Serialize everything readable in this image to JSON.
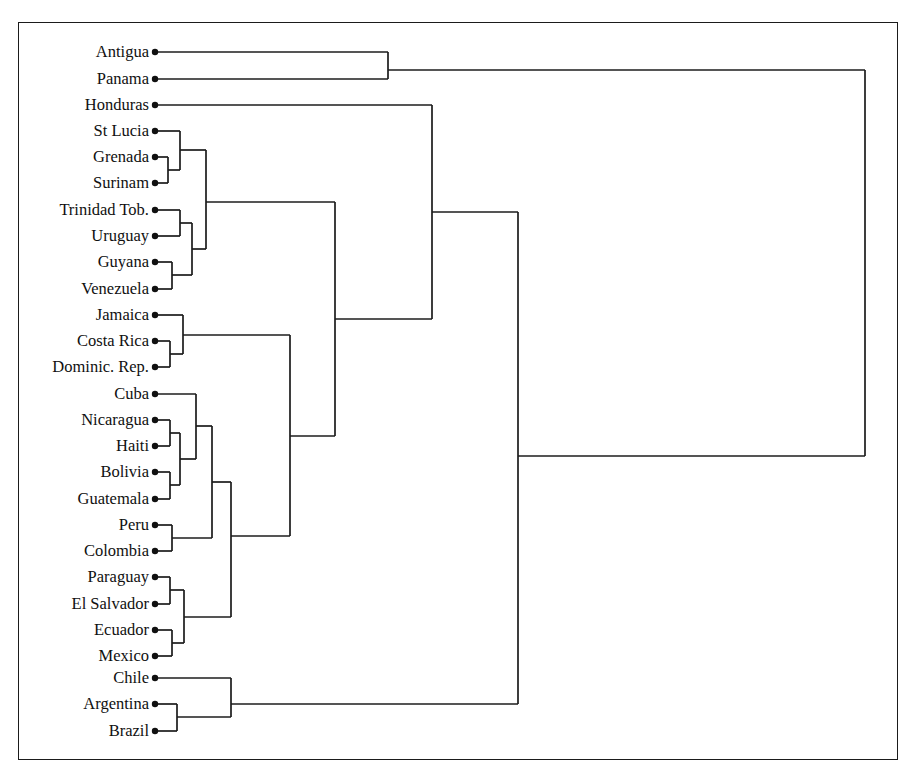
{
  "figure": {
    "type": "dendrogram",
    "orientation": "horizontal-left-to-right",
    "background_color": "#ffffff",
    "line_color": "#1c1c1c",
    "label_color": "#101010",
    "frame": {
      "x": 18,
      "y": 22,
      "width": 880,
      "height": 738,
      "border_color": "#1b1b1b"
    }
  },
  "leaves": [
    {
      "index": 0,
      "label": "Antigua",
      "x": 155,
      "y": 52
    },
    {
      "index": 1,
      "label": "Panama",
      "x": 155,
      "y": 79
    },
    {
      "index": 2,
      "label": "Honduras",
      "x": 155,
      "y": 105
    },
    {
      "index": 3,
      "label": "St Lucia",
      "x": 155,
      "y": 131
    },
    {
      "index": 4,
      "label": "Grenada",
      "x": 155,
      "y": 157
    },
    {
      "index": 5,
      "label": "Surinam",
      "x": 155,
      "y": 183
    },
    {
      "index": 6,
      "label": "Trinidad Tob.",
      "x": 155,
      "y": 210
    },
    {
      "index": 7,
      "label": "Uruguay",
      "x": 155,
      "y": 236
    },
    {
      "index": 8,
      "label": "Guyana",
      "x": 155,
      "y": 262
    },
    {
      "index": 9,
      "label": "Venezuela",
      "x": 155,
      "y": 289
    },
    {
      "index": 10,
      "label": "Jamaica",
      "x": 155,
      "y": 315
    },
    {
      "index": 11,
      "label": "Costa Rica",
      "x": 155,
      "y": 341
    },
    {
      "index": 12,
      "label": "Dominic. Rep.",
      "x": 155,
      "y": 367
    },
    {
      "index": 13,
      "label": "Cuba",
      "x": 155,
      "y": 394
    },
    {
      "index": 14,
      "label": "Nicaragua",
      "x": 155,
      "y": 420
    },
    {
      "index": 15,
      "label": "Haiti",
      "x": 155,
      "y": 446
    },
    {
      "index": 16,
      "label": "Bolivia",
      "x": 155,
      "y": 472
    },
    {
      "index": 17,
      "label": "Guatemala",
      "x": 155,
      "y": 499
    },
    {
      "index": 18,
      "label": "Peru",
      "x": 155,
      "y": 525
    },
    {
      "index": 19,
      "label": "Colombia",
      "x": 155,
      "y": 551
    },
    {
      "index": 20,
      "label": "Paraguay",
      "x": 155,
      "y": 577
    },
    {
      "index": 21,
      "label": "El Salvador",
      "x": 155,
      "y": 604
    },
    {
      "index": 22,
      "label": "Ecuador",
      "x": 155,
      "y": 630
    },
    {
      "index": 23,
      "label": "Mexico",
      "x": 155,
      "y": 656
    },
    {
      "index": 24,
      "label": "Chile",
      "x": 155,
      "y": 678
    },
    {
      "index": 25,
      "label": "Argentina",
      "x": 155,
      "y": 704
    },
    {
      "index": 26,
      "label": "Brazil",
      "x": 155,
      "y": 731
    }
  ],
  "label_right_edge": 149,
  "merges": [
    {
      "name": "grenada-surinam",
      "x": 168,
      "y1": 157,
      "y2": 183,
      "y_out": 170
    },
    {
      "name": "stlucia-grenadasurinam",
      "x": 180,
      "y1": 131,
      "y2": 170,
      "y_out": 150
    },
    {
      "name": "trinidad-uruguay",
      "x": 180,
      "y1": 210,
      "y2": 236,
      "y_out": 223
    },
    {
      "name": "guyana-venezuela",
      "x": 172,
      "y1": 262,
      "y2": 289,
      "y_out": 275
    },
    {
      "name": "trinidaduruguay-guyanaven",
      "x": 192,
      "y1": 223,
      "y2": 275,
      "y_out": 249
    },
    {
      "name": "caribbean-southamerican",
      "x": 206,
      "y1": 150,
      "y2": 249,
      "y_out": 202
    },
    {
      "name": "costarica-dominicrep",
      "x": 170,
      "y1": 341,
      "y2": 367,
      "y_out": 354
    },
    {
      "name": "jamaica-costaricadominic",
      "x": 183,
      "y1": 315,
      "y2": 354,
      "y_out": 335
    },
    {
      "name": "nicaragua-haiti",
      "x": 170,
      "y1": 420,
      "y2": 446,
      "y_out": 433
    },
    {
      "name": "bolivia-guatemala",
      "x": 170,
      "y1": 472,
      "y2": 499,
      "y_out": 485
    },
    {
      "name": "nicaraguahaiti-boliviaguat",
      "x": 180,
      "y1": 433,
      "y2": 485,
      "y_out": 459
    },
    {
      "name": "cuba-andean",
      "x": 196,
      "y1": 394,
      "y2": 459,
      "y_out": 426
    },
    {
      "name": "peru-colombia",
      "x": 172,
      "y1": 525,
      "y2": 551,
      "y_out": 538
    },
    {
      "name": "cubaandean-perucolombia",
      "x": 212,
      "y1": 426,
      "y2": 538,
      "y_out": 482
    },
    {
      "name": "paraguay-elsalvador",
      "x": 170,
      "y1": 577,
      "y2": 604,
      "y_out": 590
    },
    {
      "name": "ecuador-mexico",
      "x": 172,
      "y1": 630,
      "y2": 656,
      "y_out": 643
    },
    {
      "name": "paraguaysalv-ecuadormexico",
      "x": 184,
      "y1": 590,
      "y2": 643,
      "y_out": 617
    },
    {
      "name": "cluster-central-america",
      "x": 231,
      "y1": 482,
      "y2": 617,
      "y_out": 536
    },
    {
      "name": "jamaicagrp-centralamerica",
      "x": 290,
      "y1": 335,
      "y2": 536,
      "y_out": 436
    },
    {
      "name": "caribbean-mainland",
      "x": 335,
      "y1": 202,
      "y2": 436,
      "y_out": 319
    },
    {
      "name": "honduras-cluster",
      "x": 432,
      "y1": 105,
      "y2": 319,
      "y_out": 212
    },
    {
      "name": "argentina-brazil",
      "x": 177,
      "y1": 704,
      "y2": 731,
      "y_out": 717
    },
    {
      "name": "chile-argentinabrazil",
      "x": 231,
      "y1": 678,
      "y2": 717,
      "y_out": 704
    },
    {
      "name": "mainbody-southerncone",
      "x": 518,
      "y1": 212,
      "y2": 704,
      "y_out": 456
    },
    {
      "name": "antigua-panama",
      "x": 388,
      "y1": 52,
      "y2": 79,
      "y_out": 70
    },
    {
      "name": "root",
      "x": 865,
      "y1": 70,
      "y2": 456,
      "y_out": 263
    }
  ],
  "chart_data": {
    "type": "dendrogram",
    "title": "",
    "xlabel": "",
    "ylabel": "",
    "leaf_order": [
      "Antigua",
      "Panama",
      "Honduras",
      "St Lucia",
      "Grenada",
      "Surinam",
      "Trinidad Tob.",
      "Uruguay",
      "Guyana",
      "Venezuela",
      "Jamaica",
      "Costa Rica",
      "Dominic. Rep.",
      "Cuba",
      "Nicaragua",
      "Haiti",
      "Bolivia",
      "Guatemala",
      "Peru",
      "Colombia",
      "Paraguay",
      "El Salvador",
      "Ecuador",
      "Mexico",
      "Chile",
      "Argentina",
      "Brazil"
    ],
    "n_leaves": 27,
    "clusters": [
      {
        "members": [
          "Grenada",
          "Surinam"
        ],
        "merge_distance_px": 168
      },
      {
        "members": [
          "St Lucia",
          "Grenada",
          "Surinam"
        ],
        "merge_distance_px": 180
      },
      {
        "members": [
          "Trinidad Tob.",
          "Uruguay"
        ],
        "merge_distance_px": 180
      },
      {
        "members": [
          "Guyana",
          "Venezuela"
        ],
        "merge_distance_px": 172
      },
      {
        "members": [
          "Trinidad Tob.",
          "Uruguay",
          "Guyana",
          "Venezuela"
        ],
        "merge_distance_px": 192
      },
      {
        "members": [
          "St Lucia",
          "Grenada",
          "Surinam",
          "Trinidad Tob.",
          "Uruguay",
          "Guyana",
          "Venezuela"
        ],
        "merge_distance_px": 206
      },
      {
        "members": [
          "Costa Rica",
          "Dominic. Rep."
        ],
        "merge_distance_px": 170
      },
      {
        "members": [
          "Jamaica",
          "Costa Rica",
          "Dominic. Rep."
        ],
        "merge_distance_px": 183
      },
      {
        "members": [
          "Nicaragua",
          "Haiti"
        ],
        "merge_distance_px": 170
      },
      {
        "members": [
          "Bolivia",
          "Guatemala"
        ],
        "merge_distance_px": 170
      },
      {
        "members": [
          "Nicaragua",
          "Haiti",
          "Bolivia",
          "Guatemala"
        ],
        "merge_distance_px": 180
      },
      {
        "members": [
          "Cuba",
          "Nicaragua",
          "Haiti",
          "Bolivia",
          "Guatemala"
        ],
        "merge_distance_px": 196
      },
      {
        "members": [
          "Peru",
          "Colombia"
        ],
        "merge_distance_px": 172
      },
      {
        "members": [
          "Cuba",
          "Nicaragua",
          "Haiti",
          "Bolivia",
          "Guatemala",
          "Peru",
          "Colombia"
        ],
        "merge_distance_px": 212
      },
      {
        "members": [
          "Paraguay",
          "El Salvador"
        ],
        "merge_distance_px": 170
      },
      {
        "members": [
          "Ecuador",
          "Mexico"
        ],
        "merge_distance_px": 172
      },
      {
        "members": [
          "Paraguay",
          "El Salvador",
          "Ecuador",
          "Mexico"
        ],
        "merge_distance_px": 184
      },
      {
        "members": [
          "Cuba",
          "Nicaragua",
          "Haiti",
          "Bolivia",
          "Guatemala",
          "Peru",
          "Colombia",
          "Paraguay",
          "El Salvador",
          "Ecuador",
          "Mexico"
        ],
        "merge_distance_px": 231
      },
      {
        "members": [
          "Argentina",
          "Brazil"
        ],
        "merge_distance_px": 177
      },
      {
        "members": [
          "Chile",
          "Argentina",
          "Brazil"
        ],
        "merge_distance_px": 231
      },
      {
        "members": [
          "Jamaica",
          "Costa Rica",
          "Dominic. Rep.",
          "Cuba",
          "Nicaragua",
          "Haiti",
          "Bolivia",
          "Guatemala",
          "Peru",
          "Colombia",
          "Paraguay",
          "El Salvador",
          "Ecuador",
          "Mexico"
        ],
        "merge_distance_px": 290
      },
      {
        "members": [
          "St Lucia",
          "Grenada",
          "Surinam",
          "Trinidad Tob.",
          "Uruguay",
          "Guyana",
          "Venezuela",
          "Jamaica",
          "Costa Rica",
          "Dominic. Rep.",
          "Cuba",
          "Nicaragua",
          "Haiti",
          "Bolivia",
          "Guatemala",
          "Peru",
          "Colombia",
          "Paraguay",
          "El Salvador",
          "Ecuador",
          "Mexico"
        ],
        "merge_distance_px": 335
      },
      {
        "members": [
          "Honduras",
          "+21 others"
        ],
        "merge_distance_px": 432
      },
      {
        "members": [
          "Antigua",
          "Panama"
        ],
        "merge_distance_px": 388
      },
      {
        "members": [
          "main body",
          "Chile/Argentina/Brazil"
        ],
        "merge_distance_px": 518
      },
      {
        "members": [
          "Antigua/Panama",
          "all others"
        ],
        "merge_distance_px": 865
      }
    ]
  }
}
